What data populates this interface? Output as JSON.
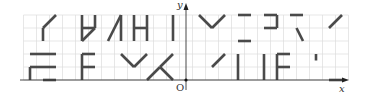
{
  "axes": {
    "x_label": "x",
    "y_label": "y",
    "origin_label": "O",
    "origin_px": [
      186,
      80
    ],
    "unit_px": 13,
    "grid_x_range": [
      -12.5,
      12.5
    ],
    "grid_y_range": [
      0,
      5
    ]
  },
  "colors": {
    "grid": "#dcdcdc",
    "axis": "#333333",
    "segment": "#4a4a4a"
  },
  "segments": [
    [
      [
        -10,
        5
      ],
      [
        -11,
        4
      ]
    ],
    [
      [
        -11,
        4
      ],
      [
        -11,
        3
      ]
    ],
    [
      [
        -8,
        5
      ],
      [
        -8,
        3
      ]
    ],
    [
      [
        -7,
        5
      ],
      [
        -7,
        4
      ]
    ],
    [
      [
        -8,
        4
      ],
      [
        -7,
        4
      ]
    ],
    [
      [
        -7,
        4
      ],
      [
        -8,
        3
      ]
    ],
    [
      [
        -5,
        5
      ],
      [
        -6,
        3
      ]
    ],
    [
      [
        -5,
        5
      ],
      [
        -5,
        3
      ]
    ],
    [
      [
        -4,
        5
      ],
      [
        -4,
        3
      ]
    ],
    [
      [
        -4,
        4
      ],
      [
        -3,
        4
      ]
    ],
    [
      [
        -3,
        5
      ],
      [
        -3,
        3
      ]
    ],
    [
      [
        -1,
        5
      ],
      [
        -1,
        3
      ]
    ],
    [
      [
        -12,
        2
      ],
      [
        -10,
        2
      ]
    ],
    [
      [
        -12,
        1
      ],
      [
        -10,
        1
      ]
    ],
    [
      [
        -12,
        1
      ],
      [
        -12,
        0
      ]
    ],
    [
      [
        -11,
        0
      ],
      [
        -10,
        0
      ]
    ],
    [
      [
        -8,
        2
      ],
      [
        -8,
        0
      ]
    ],
    [
      [
        -8,
        2
      ],
      [
        -7,
        2
      ]
    ],
    [
      [
        -8,
        1
      ],
      [
        -7,
        1
      ]
    ],
    [
      [
        -5,
        2
      ],
      [
        -4,
        1
      ]
    ],
    [
      [
        -4,
        1
      ],
      [
        -3,
        2
      ]
    ],
    [
      [
        -1,
        2
      ],
      [
        -2,
        1
      ]
    ],
    [
      [
        -2,
        1
      ],
      [
        -3,
        0
      ]
    ],
    [
      [
        -2,
        1
      ],
      [
        -1,
        0
      ]
    ],
    [
      [
        1,
        5
      ],
      [
        2,
        4
      ]
    ],
    [
      [
        2,
        4
      ],
      [
        3,
        5
      ]
    ],
    [
      [
        4,
        5
      ],
      [
        5,
        5
      ]
    ],
    [
      [
        4,
        3
      ],
      [
        5,
        3
      ]
    ],
    [
      [
        6,
        5
      ],
      [
        7,
        5
      ]
    ],
    [
      [
        7,
        5
      ],
      [
        7,
        4
      ]
    ],
    [
      [
        6,
        4
      ],
      [
        7,
        4
      ]
    ],
    [
      [
        8,
        5
      ],
      [
        9,
        5
      ]
    ],
    [
      [
        8.5,
        4
      ],
      [
        9,
        3
      ]
    ],
    [
      [
        11,
        4
      ],
      [
        12,
        5
      ]
    ],
    [
      [
        2,
        1
      ],
      [
        3,
        2
      ]
    ],
    [
      [
        4,
        2
      ],
      [
        4,
        0
      ]
    ],
    [
      [
        6,
        2
      ],
      [
        6,
        0
      ]
    ],
    [
      [
        7,
        2
      ],
      [
        7,
        0
      ]
    ],
    [
      [
        7,
        2
      ],
      [
        8,
        2
      ]
    ],
    [
      [
        7,
        1
      ],
      [
        8,
        1
      ]
    ],
    [
      [
        10,
        2
      ],
      [
        10,
        1.5
      ]
    ],
    [
      [
        11,
        0
      ],
      [
        12,
        0
      ]
    ]
  ]
}
